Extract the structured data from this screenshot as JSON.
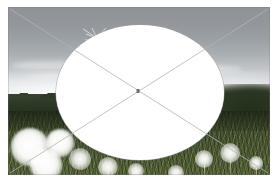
{
  "scene": {
    "title": "Dandelion field photograph with ellipse selection overlay",
    "alt": "Meadow of dandelion seed heads under an overcast sky, covered by a large white ellipse",
    "canvas": {
      "width": 278,
      "height": 189,
      "background_color": "#ffffff"
    }
  },
  "photo": {
    "name": "dandelion-meadow-photo",
    "left": 8,
    "top": 7,
    "width": 262,
    "height": 168,
    "regions": [
      {
        "name": "sky",
        "label": "Overcast gray sky",
        "color": "#9aa0a4",
        "top_pct": 0,
        "height_pct": 56
      },
      {
        "name": "treeline",
        "label": "Distant dark treeline",
        "color": "#2e3a28",
        "top_pct": 52,
        "height_pct": 11
      },
      {
        "name": "meadow",
        "label": "Green meadow grass",
        "color": "#4b5833",
        "top_pct": 62,
        "height_pct": 38
      }
    ]
  },
  "overlay": {
    "ellipse": {
      "name": "white-ellipse-overlay",
      "fill_color": "#ffffff",
      "stroke_color": "#a0a0a0",
      "left": 48,
      "top": 18,
      "width": 168,
      "height": 135,
      "center_x": 132,
      "center_y": 85.5
    },
    "guide_lines": {
      "name": "diagonal-guide-lines",
      "stroke_color": "#b4b4b4",
      "stroke_width": 0.8,
      "lines": [
        {
          "name": "diagonal-line-tl-br",
          "x1": 2,
          "y1": 2,
          "x2": 260,
          "y2": 166
        },
        {
          "name": "diagonal-line-tr-bl",
          "x1": 260,
          "y1": 2,
          "x2": 2,
          "y2": 166
        }
      ]
    },
    "center_marker": {
      "name": "center-marker",
      "color": "#6f6f6f",
      "x": 130,
      "y": 84,
      "width": 3,
      "height": 4
    }
  },
  "elements": {
    "floating_seed": {
      "name": "floating-dandelion-seed",
      "label": "Airborne dandelion pappus",
      "x": 72,
      "y": 18,
      "color": "#f2f4f0"
    },
    "puffs": [
      {
        "name": "dandelion-puff-left-1",
        "x": 22,
        "y": 140,
        "r": 19,
        "bright": true
      },
      {
        "name": "dandelion-puff-left-2",
        "x": 52,
        "y": 136,
        "r": 14,
        "bright": true
      },
      {
        "name": "dandelion-puff-left-3",
        "x": 38,
        "y": 158,
        "r": 16,
        "bright": true
      },
      {
        "name": "dandelion-puff-left-4",
        "x": 72,
        "y": 152,
        "r": 11,
        "bright": false
      },
      {
        "name": "dandelion-puff-mid-1",
        "x": 100,
        "y": 160,
        "r": 10,
        "bright": false
      },
      {
        "name": "dandelion-puff-mid-2",
        "x": 128,
        "y": 164,
        "r": 8,
        "bright": false
      },
      {
        "name": "dandelion-puff-right-1",
        "x": 196,
        "y": 152,
        "r": 9,
        "bright": false
      },
      {
        "name": "dandelion-puff-right-2",
        "x": 222,
        "y": 146,
        "r": 10,
        "bright": false
      },
      {
        "name": "dandelion-puff-right-3",
        "x": 248,
        "y": 156,
        "r": 7,
        "bright": false
      },
      {
        "name": "dandelion-puff-right-4",
        "x": 168,
        "y": 166,
        "r": 8,
        "bright": false
      }
    ],
    "stems": [
      {
        "name": "dandelion-stem-1",
        "x": 196,
        "y": 158,
        "h": 16
      },
      {
        "name": "dandelion-stem-2",
        "x": 222,
        "y": 152,
        "h": 18
      },
      {
        "name": "dandelion-stem-3",
        "x": 248,
        "y": 161,
        "h": 12
      },
      {
        "name": "dandelion-stem-4",
        "x": 168,
        "y": 170,
        "h": 8
      },
      {
        "name": "dandelion-stem-5",
        "x": 100,
        "y": 166,
        "h": 10
      }
    ],
    "cloud_streaks": [
      {
        "name": "cloud-streak-1",
        "x": 4,
        "y": 54,
        "w": 78,
        "h": 9
      },
      {
        "name": "cloud-streak-2",
        "x": 64,
        "y": 48,
        "w": 96,
        "h": 7
      },
      {
        "name": "cloud-streak-3",
        "x": 150,
        "y": 58,
        "w": 84,
        "h": 8
      },
      {
        "name": "cloud-streak-4",
        "x": 18,
        "y": 66,
        "w": 120,
        "h": 6
      }
    ]
  }
}
